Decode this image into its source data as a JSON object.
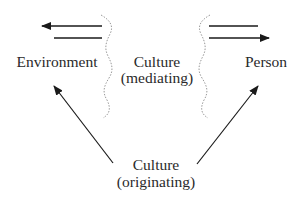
{
  "diagram": {
    "type": "conceptual-flow",
    "nodes": {
      "environment": {
        "label": "Environment"
      },
      "person": {
        "label": "Person"
      },
      "culture_mediating": {
        "line1": "Culture",
        "line2": "(mediating)"
      },
      "culture_originating": {
        "line1": "Culture",
        "line2": "(originating)"
      }
    },
    "edges": [
      {
        "from": "culture_mediating",
        "to": "environment",
        "style": "solid-arrow"
      },
      {
        "from": "environment",
        "to": "culture_mediating",
        "style": "solid-line"
      },
      {
        "from": "person",
        "to": "culture_mediating",
        "style": "solid-line"
      },
      {
        "from": "culture_mediating",
        "to": "person",
        "style": "solid-arrow"
      },
      {
        "from": "culture_originating",
        "to": "environment",
        "style": "solid-arrow"
      },
      {
        "from": "culture_originating",
        "to": "person",
        "style": "solid-arrow"
      }
    ],
    "boundaries": [
      {
        "name": "left-boundary",
        "style": "dotted-wavy"
      },
      {
        "name": "right-boundary",
        "style": "dotted-wavy"
      }
    ],
    "colors": {
      "line": "#1a1a1a",
      "boundary": "#9a9a9a",
      "text": "#2a2a2a",
      "background": "#ffffff"
    }
  }
}
